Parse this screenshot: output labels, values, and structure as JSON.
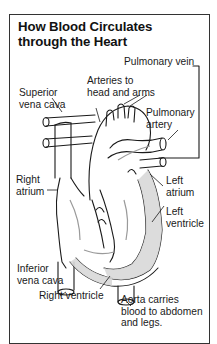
{
  "title": {
    "line1": "How Blood Circulates",
    "line2": "through the Heart"
  },
  "labels": {
    "pulmonary_vein": "Pulmonary vein",
    "arteries_to_head_l1": "Arteries to",
    "arteries_to_head_l2": "head and arms",
    "superior_vena_cava_l1": "Superior",
    "superior_vena_cava_l2": "vena cava",
    "pulmonary_artery_l1": "Pulmonary",
    "pulmonary_artery_l2": "artery",
    "right_atrium_l1": "Right",
    "right_atrium_l2": "atrium",
    "left_atrium_l1": "Left",
    "left_atrium_l2": "atrium",
    "left_ventricle_l1": "Left",
    "left_ventricle_l2": "ventricle",
    "inferior_vena_cava_l1": "Inferior",
    "inferior_vena_cava_l2": "vena cava",
    "right_ventricle": "Right ventricle",
    "aorta_l1": "Aorta carries",
    "aorta_l2": "blood to abdomen",
    "aorta_l3": "and legs."
  },
  "colors": {
    "ink": "#1a1a1a",
    "frame": "#333333",
    "muscle_fill": "#d9d9d9",
    "arrow": "#9a9a9a"
  }
}
